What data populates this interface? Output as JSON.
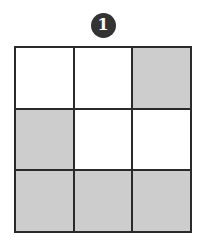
{
  "figure": {
    "label": "1",
    "badge_icon": "numbered-circle-badge",
    "colors": {
      "badge_background": "#333333",
      "badge_text": "#ffffff",
      "grid_line": "#2a2a2a",
      "cell_filled": "#cdcdcd",
      "cell_empty": "#ffffff",
      "page_background": "#ffffff"
    }
  },
  "chart_data": {
    "type": "heatmap",
    "title": "1",
    "xlabel": "",
    "ylabel": "",
    "rows": 3,
    "cols": 3,
    "legend": [
      {
        "state": "empty",
        "color": "#ffffff"
      },
      {
        "state": "filled",
        "color": "#cdcdcd"
      }
    ],
    "values": [
      [
        0,
        0,
        1
      ],
      [
        1,
        0,
        0
      ],
      [
        1,
        1,
        1
      ]
    ],
    "cells": [
      {
        "row": 0,
        "col": 0,
        "state": "empty"
      },
      {
        "row": 0,
        "col": 1,
        "state": "empty"
      },
      {
        "row": 0,
        "col": 2,
        "state": "filled"
      },
      {
        "row": 1,
        "col": 0,
        "state": "filled"
      },
      {
        "row": 1,
        "col": 1,
        "state": "empty"
      },
      {
        "row": 1,
        "col": 2,
        "state": "empty"
      },
      {
        "row": 2,
        "col": 0,
        "state": "filled"
      },
      {
        "row": 2,
        "col": 1,
        "state": "filled"
      },
      {
        "row": 2,
        "col": 2,
        "state": "filled"
      }
    ]
  }
}
